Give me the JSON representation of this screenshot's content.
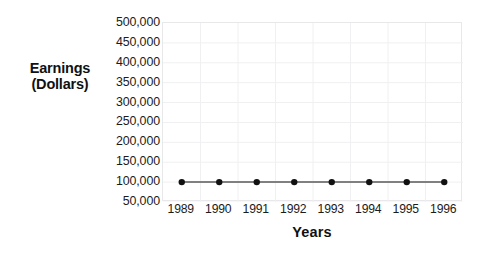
{
  "chart_data": {
    "type": "line",
    "title": "",
    "xlabel": "Years",
    "ylabel": "Earnings (Dollars)",
    "ylabel_line1": "Earnings",
    "ylabel_line2": "(Dollars)",
    "categories": [
      "1989",
      "1990",
      "1991",
      "1992",
      "1993",
      "1994",
      "1995",
      "1996"
    ],
    "series": [
      {
        "name": "Earnings",
        "values": [
          100000,
          100000,
          100000,
          100000,
          100000,
          100000,
          100000,
          100000
        ],
        "line_color": "#808080",
        "marker_color": "#111111"
      }
    ],
    "annotations": [
      {
        "name": "faint-diagonal-artifact",
        "description": "Faint light-gray diagonal line rising between 1993 and 1994",
        "x_start": "1993.6",
        "y_start": 100000,
        "x_end": "1994.5",
        "y_end": 310000,
        "color": "#ededef"
      }
    ],
    "ylim": [
      50000,
      500000
    ],
    "y_ticks": [
      "500,000",
      "450,000",
      "400,000",
      "350,000",
      "300,000",
      "250,000",
      "200,000",
      "150,000",
      "100,000",
      "50,000"
    ],
    "y_tick_values": [
      500000,
      450000,
      400000,
      350000,
      300000,
      250000,
      200000,
      150000,
      100000,
      50000
    ],
    "grid": true,
    "grid_color": "#f0f0f2",
    "legend": "none",
    "background_color": "#ffffff"
  }
}
